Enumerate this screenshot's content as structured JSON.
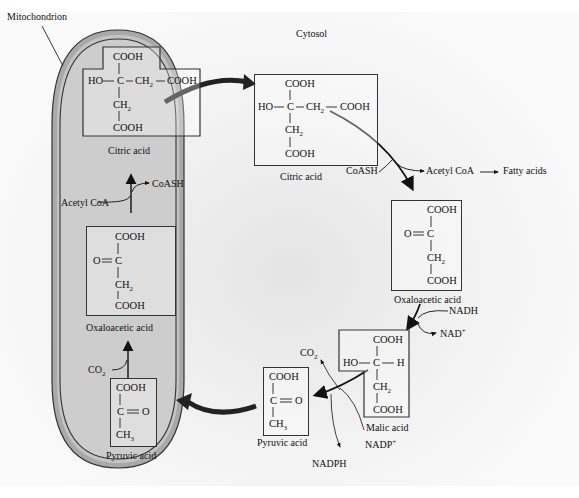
{
  "regions": {
    "mitochondrion": "Mitochondrion",
    "cytosol": "Cytosol"
  },
  "mitochondrion": {
    "citric_acid": {
      "name": "Citric acid",
      "top": "COOH",
      "left": "HO",
      "center": "C",
      "right1": "CH2",
      "right2": "COOH",
      "below1": "CH2",
      "below2": "COOH"
    },
    "acetyl_step": {
      "input": "Acetyl CoA",
      "output": "CoASH"
    },
    "oxaloacetic_acid": {
      "name": "Oxaloacetic acid",
      "top": "COOH",
      "left": "O",
      "center": "C",
      "below1": "CH2",
      "below2": "COOH"
    },
    "co2_step": {
      "input": "CO2"
    },
    "pyruvic_acid": {
      "name": "Pyruvic acid",
      "top": "COOH",
      "center": "C",
      "right": "O",
      "bottom": "CH3"
    }
  },
  "cytosol": {
    "citric_acid": {
      "name": "Citric acid",
      "top": "COOH",
      "left": "HO",
      "center": "C",
      "right1": "CH2",
      "right2": "COOH",
      "below1": "CH2",
      "below2": "COOH"
    },
    "cleavage_step": {
      "input": "CoASH",
      "output": "Acetyl CoA",
      "product": "Fatty acids"
    },
    "oxaloacetic_acid": {
      "name": "Oxaloacetic acid",
      "top": "COOH",
      "left": "O",
      "center": "C",
      "below1": "CH2",
      "below2": "COOH"
    },
    "reduction_step": {
      "input": "NADH",
      "output": "NAD+"
    },
    "malic_acid": {
      "name": "Malic acid",
      "top": "COOH",
      "left": "HO",
      "center": "C",
      "right": "H",
      "below1": "CH2",
      "below2": "COOH"
    },
    "decarboxylation_step": {
      "co2": "CO2",
      "input": "NADP+",
      "output": "NADPH"
    },
    "pyruvic_acid": {
      "name": "Pyruvic acid",
      "top": "COOH",
      "center": "C",
      "right": "O",
      "bottom": "CH3"
    }
  }
}
